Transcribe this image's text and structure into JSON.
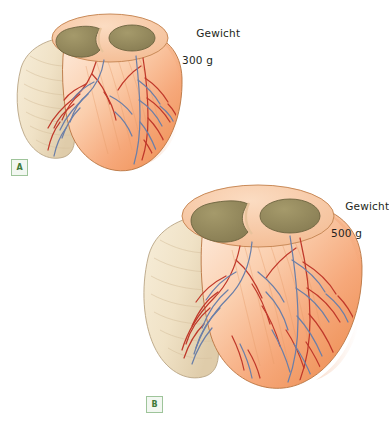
{
  "figure": {
    "background_color": "#ffffff"
  },
  "palette": {
    "myocardium_light": "#fbd9bf",
    "myocardium_mid": "#f6a977",
    "myocardium_deep": "#ef8f54",
    "appendage_cream": "#f2e6cf",
    "appendage_shadow": "#e3d2b2",
    "cavity_olive": "#8d8257",
    "cavity_olive_light": "#a89c6d",
    "artery_red": "#c0392b",
    "vein_blue": "#6b7fa8",
    "outline": "#6b5342",
    "label_text": "#231f20",
    "tag_border": "#9ec49a",
    "tag_fill": "#f2f7f1",
    "tag_text": "#3f7a3a"
  },
  "specimens": [
    {
      "id": "A",
      "tag_label": "A",
      "weight_label_line1": "Gewicht",
      "weight_label_line2": "300 g",
      "weight_value": "300",
      "weight_unit": "g",
      "caption_term": "Gewicht",
      "relative_size": "normal"
    },
    {
      "id": "B",
      "tag_label": "B",
      "weight_label_line1": "Gewicht",
      "weight_label_line2": "500 g",
      "weight_value": "500",
      "weight_unit": "g",
      "caption_term": "Gewicht",
      "relative_size": "enlarged"
    }
  ],
  "anatomy_parts": [
    "left-ventricle-cavity",
    "right-ventricle-cavity",
    "interventricular-septum",
    "atrial-appendage",
    "myocardium-surface",
    "coronary-arteries",
    "coronary-veins"
  ]
}
